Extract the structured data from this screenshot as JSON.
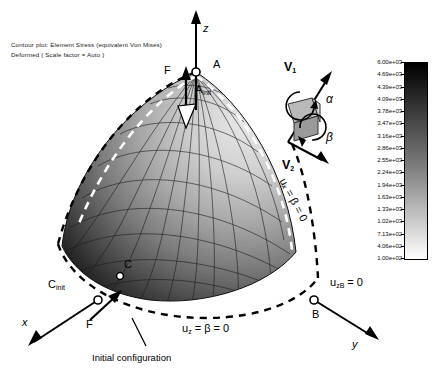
{
  "header": {
    "line1": "Contour plot:  Element Stress (equivalent Von Mises)",
    "line2": "Deformed ( Scale factor = Auto )"
  },
  "axes": {
    "z": "z",
    "x": "x",
    "y": "y"
  },
  "force_labels": {
    "apex": "F",
    "base": "F"
  },
  "nodes": {
    "a": "A",
    "a_init_main": "A",
    "a_init_sub": "init",
    "c": "C",
    "c_init_main": "C",
    "c_init_sub": "init",
    "b": "B"
  },
  "boundary_conditions": {
    "right_edge": "uₓ = β = 0",
    "bottom": "uᵣ = β = 0",
    "bottom_plain_main": "u",
    "bottom_plain_sub": "z",
    "bottom_plain_rest": "= β = 0",
    "node_b_main": "u",
    "node_b_sub": "zB",
    "node_b_rest": "= 0"
  },
  "vector_diagram": {
    "v1_main": "V",
    "v1_sub": "1",
    "v2_main": "V",
    "v2_sub": "2",
    "alpha": "α",
    "beta": "β"
  },
  "caption": {
    "initial_configuration": "Initial configuration"
  },
  "colorbar": {
    "title": "Element Stress (equivalent Von Mises)",
    "ticks": [
      "6.00e+03",
      "4.69e+03",
      "4.39e+03",
      "4.09e+03",
      "3.78e+03",
      "3.47e+03",
      "3.16e+03",
      "2.86e+03",
      "2.55e+03",
      "2.24e+03",
      "1.94e+03",
      "1.63e+03",
      "1.33e+03",
      "1.02e+03",
      "7.13e+02",
      "4.06e+02",
      "1.00e+02"
    ],
    "max": "6.00e+03",
    "min": "1.00e+02",
    "high_color": "#000000",
    "low_color": "#ffffff"
  },
  "chart_data": {
    "type": "heatmap",
    "title": "Contour plot: Element Stress (equivalent Von Mises)",
    "subtitle": "Deformed ( Scale factor = Auto )",
    "colormap": "grayscale-inverted",
    "units": "stress",
    "scale_min": 100,
    "scale_max": 6000,
    "legend_position": "right",
    "tick_values": [
      6000,
      4690,
      4390,
      4090,
      3780,
      3470,
      3160,
      2860,
      2550,
      2240,
      1940,
      1630,
      1330,
      1020,
      713,
      406,
      100
    ],
    "annotations": [
      "A",
      "A_init",
      "C",
      "C_init",
      "B",
      "F",
      "z",
      "x",
      "y",
      "u_x = beta = 0",
      "u_z = beta = 0",
      "u_zB = 0",
      "V1",
      "V2",
      "alpha",
      "beta",
      "Initial configuration"
    ]
  }
}
